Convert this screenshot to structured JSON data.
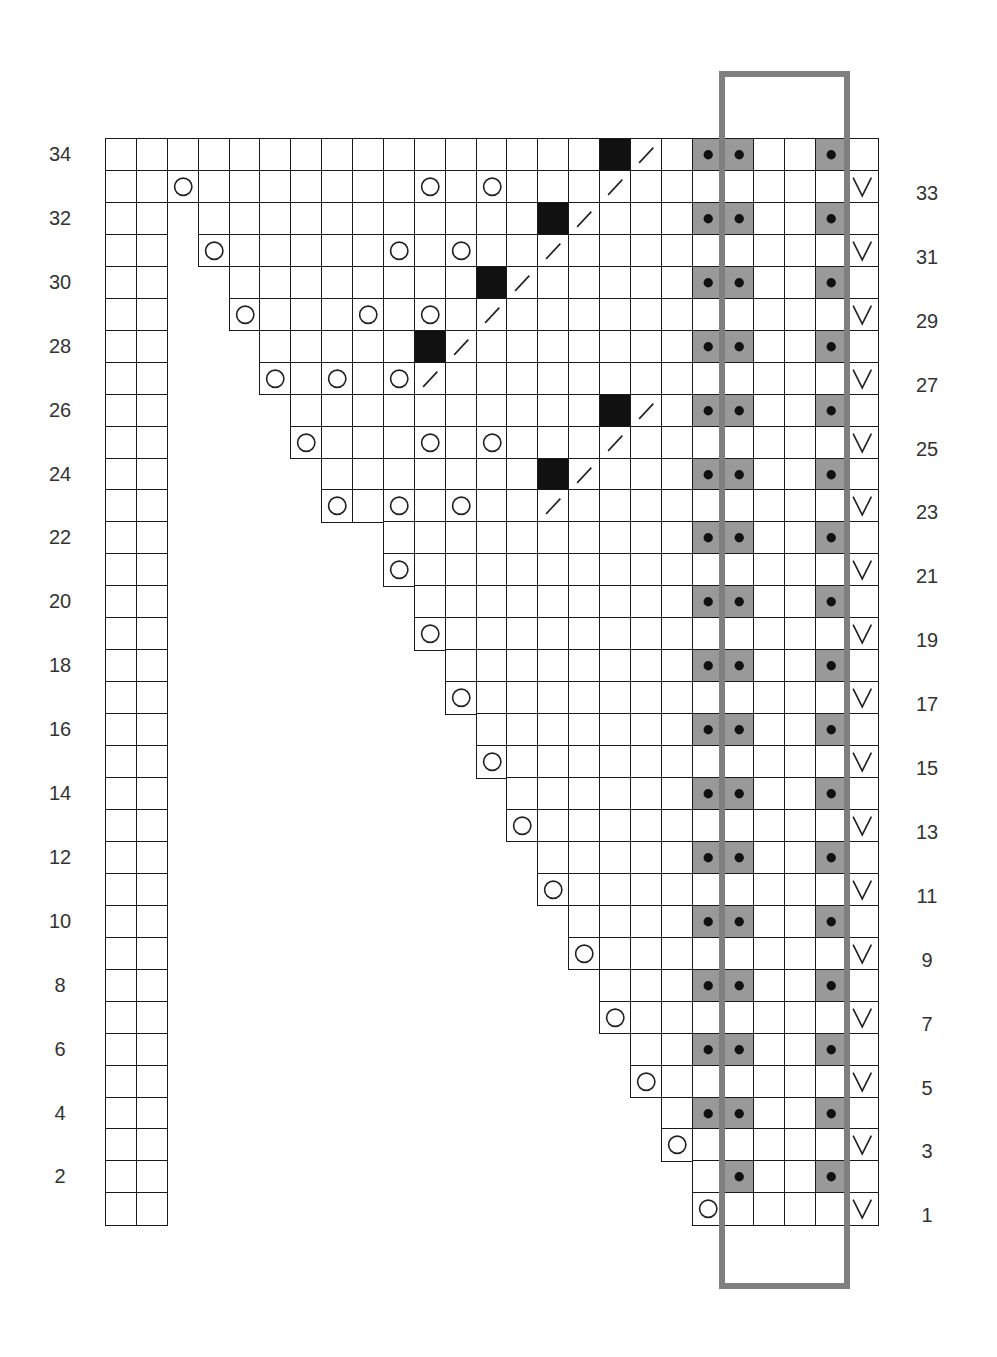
{
  "chart": {
    "columns": 25,
    "rows": 34,
    "legend_symbols": {
      "blank": "knit / plain square",
      "O": "yarn over",
      "slash": "k2tog",
      "black": "no stitch",
      "dot": "purl (gray shaded)",
      "V": "slip stitch"
    },
    "colors": {
      "grid_line": "#1a1a1a",
      "gray_cell": "#999999",
      "black_cell": "#111111",
      "repeat_box": "#7f7f7f"
    },
    "left_labels": [
      "34",
      "32",
      "30",
      "28",
      "26",
      "24",
      "22",
      "20",
      "18",
      "16",
      "14",
      "12",
      "10",
      "8",
      "6",
      "4",
      "2"
    ],
    "right_labels": [
      "33",
      "31",
      "29",
      "27",
      "25",
      "23",
      "21",
      "19",
      "17",
      "15",
      "13",
      "11",
      "9",
      "7",
      "5",
      "3",
      "1"
    ],
    "row_start_col": {
      "34": 0,
      "33": 2,
      "32": 3,
      "31": 3,
      "30": 4,
      "29": 4,
      "28": 5,
      "27": 5,
      "26": 6,
      "25": 6,
      "24": 7,
      "23": 7,
      "22": 9,
      "21": 9,
      "20": 10,
      "19": 10,
      "18": 11,
      "17": 11,
      "16": 12,
      "15": 12,
      "14": 13,
      "13": 13,
      "12": 14,
      "11": 14,
      "10": 15,
      "9": 15,
      "8": 16,
      "7": 16,
      "6": 17,
      "5": 17,
      "4": 18,
      "3": 18,
      "2": 19,
      "1": 19
    },
    "left_strip_cols": [
      0,
      1
    ],
    "symbols": {
      "34": {
        "black": [
          16
        ],
        "slash": [
          17
        ],
        "dot": [
          19,
          20,
          23
        ]
      },
      "33": {
        "O": [
          2,
          10,
          12
        ],
        "slash": [
          16
        ],
        "V": [
          24
        ]
      },
      "32": {
        "black": [
          14
        ],
        "slash": [
          15
        ],
        "dot": [
          19,
          20,
          23
        ]
      },
      "31": {
        "O": [
          3,
          9,
          11
        ],
        "slash": [
          14
        ],
        "V": [
          24
        ]
      },
      "30": {
        "black": [
          12
        ],
        "slash": [
          13
        ],
        "dot": [
          19,
          20,
          23
        ]
      },
      "29": {
        "O": [
          4,
          8,
          10
        ],
        "slash": [
          12
        ],
        "V": [
          24
        ]
      },
      "28": {
        "black": [
          10
        ],
        "slash": [
          11
        ],
        "dot": [
          19,
          20,
          23
        ]
      },
      "27": {
        "O": [
          5,
          7,
          9
        ],
        "slash": [
          10
        ],
        "V": [
          24
        ]
      },
      "26": {
        "black": [
          16
        ],
        "slash": [
          17
        ],
        "dot": [
          19,
          20,
          23
        ]
      },
      "25": {
        "O": [
          6,
          10,
          12
        ],
        "slash": [
          16
        ],
        "V": [
          24
        ]
      },
      "24": {
        "black": [
          14
        ],
        "slash": [
          15
        ],
        "dot": [
          19,
          20,
          23
        ]
      },
      "23": {
        "O": [
          7,
          9,
          11
        ],
        "slash": [
          14
        ],
        "V": [
          24
        ]
      },
      "22": {
        "dot": [
          19,
          20,
          23
        ]
      },
      "21": {
        "O": [
          9
        ],
        "V": [
          24
        ]
      },
      "20": {
        "dot": [
          19,
          20,
          23
        ]
      },
      "19": {
        "O": [
          10
        ],
        "V": [
          24
        ]
      },
      "18": {
        "dot": [
          19,
          20,
          23
        ]
      },
      "17": {
        "O": [
          11
        ],
        "V": [
          24
        ]
      },
      "16": {
        "dot": [
          19,
          20,
          23
        ]
      },
      "15": {
        "O": [
          12
        ],
        "V": [
          24
        ]
      },
      "14": {
        "dot": [
          19,
          20,
          23
        ]
      },
      "13": {
        "O": [
          13
        ],
        "V": [
          24
        ]
      },
      "12": {
        "dot": [
          19,
          20,
          23
        ]
      },
      "11": {
        "O": [
          14
        ],
        "V": [
          24
        ]
      },
      "10": {
        "dot": [
          19,
          20,
          23
        ]
      },
      "9": {
        "O": [
          15
        ],
        "V": [
          24
        ]
      },
      "8": {
        "dot": [
          19,
          20,
          23
        ]
      },
      "7": {
        "O": [
          16
        ],
        "V": [
          24
        ]
      },
      "6": {
        "dot": [
          19,
          20,
          23
        ]
      },
      "5": {
        "O": [
          17
        ],
        "V": [
          24
        ]
      },
      "4": {
        "dot": [
          19,
          20,
          23
        ]
      },
      "3": {
        "O": [
          18
        ],
        "V": [
          24
        ]
      },
      "2": {
        "dot": [
          20,
          23
        ]
      },
      "1": {
        "O": [
          19
        ],
        "V": [
          24
        ]
      }
    },
    "repeat_box": {
      "from_col": 20,
      "to_col": 23,
      "label": "repeat"
    }
  }
}
